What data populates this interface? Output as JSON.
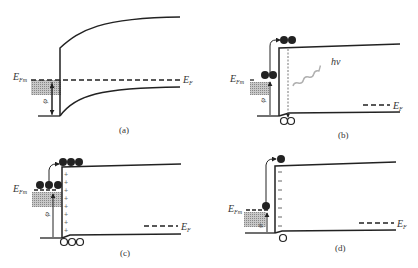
{
  "figure": {
    "panels": [
      {
        "id": "a",
        "caption": "(a)",
        "metal_fermi_label": "E",
        "metal_fermi_sub": "Fm",
        "semi_fermi_label": "E",
        "semi_fermi_sub": "F",
        "barrier_label": "φ",
        "barrier_sub": "b"
      },
      {
        "id": "b",
        "caption": "(b)",
        "metal_fermi_label": "E",
        "metal_fermi_sub": "Fm",
        "semi_fermi_label": "E",
        "semi_fermi_sub": "F",
        "barrier_label": "φ",
        "barrier_sub": "b",
        "photon_label": "hν",
        "electrons_top": 2,
        "electrons_metal": 2,
        "holes": 2
      },
      {
        "id": "c",
        "caption": "(c)",
        "metal_fermi_label": "E",
        "metal_fermi_sub": "Fm",
        "semi_fermi_label": "E",
        "semi_fermi_sub": "F",
        "barrier_label": "φ",
        "barrier_sub": "b",
        "electrons_top": 3,
        "electrons_metal": 3,
        "holes": 3,
        "charge_sign": "+"
      },
      {
        "id": "d",
        "caption": "(d)",
        "metal_fermi_label": "E",
        "metal_fermi_sub": "Fm",
        "semi_fermi_label": "E",
        "semi_fermi_sub": "F",
        "barrier_label": "φ",
        "barrier_sub": "b",
        "electrons_top": 1,
        "electrons_metal": 1,
        "holes": 1,
        "charge_sign": "−"
      }
    ]
  },
  "colors": {
    "line": "#2a2a2a",
    "metal_fill": "#9a9a9a",
    "photon": "#b0b0b0"
  }
}
